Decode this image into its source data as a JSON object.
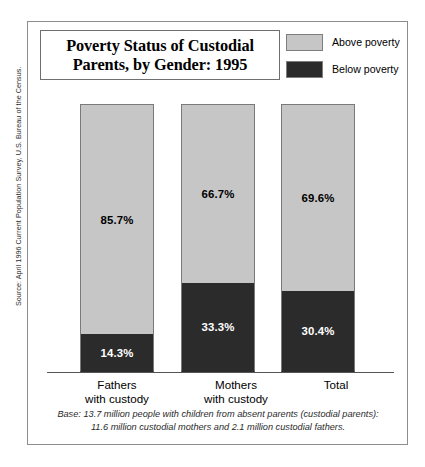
{
  "source_note": "Source: April 1996 Current Population Survey, U.S. Bureau of the Census.",
  "title": {
    "line1": "Poverty Status of Custodial",
    "line2": "Parents, by Gender: 1995"
  },
  "legend": {
    "items": [
      {
        "label": "Above poverty",
        "color": "#c6c6c6"
      },
      {
        "label": "Below poverty",
        "color": "#2b2b2b"
      }
    ]
  },
  "footnote": {
    "line1": "Base: 13.7 million people with children from absent parents (custodial parents):",
    "line2": "11.6 million custodial mothers and 2.1 million custodial fathers."
  },
  "chart_data": {
    "type": "bar",
    "title": "Poverty Status of Custodial Parents, by Gender: 1995",
    "subtitle": "",
    "xlabel": "",
    "ylabel": "",
    "ylim": [
      0,
      100
    ],
    "grid": false,
    "stacked": true,
    "legend_position": "top-right",
    "value_suffix": "%",
    "categories": [
      "Fathers\nwith custody",
      "Mothers\nwith custody",
      "Total"
    ],
    "category_labels": [
      {
        "line1": "Fathers",
        "line2": "with custody"
      },
      {
        "line1": "Mothers",
        "line2": "with custody"
      },
      {
        "line1": "Total",
        "line2": ""
      }
    ],
    "series": [
      {
        "name": "Above poverty",
        "color": "#c6c6c6",
        "text_color": "#000000",
        "values": [
          85.7,
          66.7,
          69.6
        ],
        "labels": [
          "85.7%",
          "66.7%",
          "69.6%"
        ]
      },
      {
        "name": "Below poverty",
        "color": "#2b2b2b",
        "text_color": "#ffffff",
        "values": [
          14.3,
          33.3,
          30.4
        ],
        "labels": [
          "14.3%",
          "33.3%",
          "30.4%"
        ]
      }
    ],
    "annotations": [
      "Base: 13.7 million people with children from absent parents (custodial parents): 11.6 million custodial mothers and 2.1 million custodial fathers."
    ]
  },
  "footnote_style": {
    "color": "#2a2a2a"
  }
}
